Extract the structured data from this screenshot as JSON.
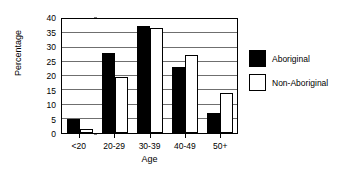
{
  "chart_data": {
    "type": "bar",
    "title": "",
    "xlabel": "Age",
    "ylabel": "Percentage",
    "categories": [
      "<20",
      "20-29",
      "30-39",
      "40-49",
      "50+"
    ],
    "series": [
      {
        "name": "Aboriginal",
        "color": "#000000",
        "values": [
          5,
          28,
          37.5,
          23,
          7
        ]
      },
      {
        "name": "Non-Aboriginal",
        "color": "#ffffff",
        "values": [
          1.5,
          19.5,
          37,
          27.5,
          14
        ]
      }
    ],
    "ylim": [
      0,
      40
    ],
    "yticks": [
      0,
      5,
      10,
      15,
      20,
      25,
      30,
      35,
      40
    ],
    "ytick_labels": [
      "0",
      "5",
      "10",
      "15",
      "20",
      "25",
      "30",
      "35",
      "40"
    ],
    "grid": true,
    "legend_position": "right-outside"
  },
  "legend": {
    "items": [
      {
        "label": "Aboriginal",
        "style": "dark"
      },
      {
        "label": "Non-Aboriginal",
        "style": "light"
      }
    ]
  }
}
